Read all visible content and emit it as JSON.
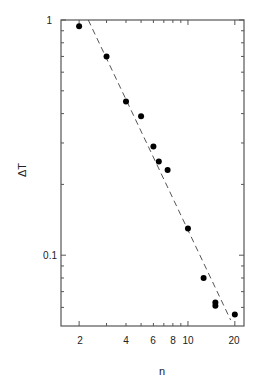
{
  "chart_data": {
    "type": "scatter",
    "title": "",
    "xlabel": "n",
    "ylabel": "ΔT",
    "xscale": "log",
    "yscale": "log",
    "xlim": [
      1.53,
      22.9
    ],
    "ylim": [
      0.05,
      1
    ],
    "grid": false,
    "legend": null,
    "x_ticks": [
      2,
      4,
      6,
      8,
      10,
      20
    ],
    "x_tick_labels": [
      "2",
      "4",
      "6",
      "8",
      "10",
      "20"
    ],
    "y_ticks": [
      1,
      0.1
    ],
    "y_tick_labels": [
      "1",
      "0.1"
    ],
    "series": [
      {
        "name": "data",
        "style": "filled-circle",
        "color": "#000000",
        "points": [
          {
            "x": 2,
            "y": 0.94
          },
          {
            "x": 3,
            "y": 0.7
          },
          {
            "x": 4,
            "y": 0.45
          },
          {
            "x": 5,
            "y": 0.39
          },
          {
            "x": 6,
            "y": 0.29
          },
          {
            "x": 6.5,
            "y": 0.25
          },
          {
            "x": 7.4,
            "y": 0.23
          },
          {
            "x": 10,
            "y": 0.13
          },
          {
            "x": 12.6,
            "y": 0.08
          },
          {
            "x": 15,
            "y": 0.063
          },
          {
            "x": 15,
            "y": 0.061
          },
          {
            "x": 20,
            "y": 0.056
          }
        ]
      },
      {
        "name": "fit",
        "style": "dashed-line",
        "color": "#555555",
        "points": [
          {
            "x": 2.29,
            "y": 1.0
          },
          {
            "x": 18.8,
            "y": 0.053
          }
        ]
      }
    ]
  },
  "labels": {
    "xlabel": "n",
    "ylabel": "ΔT",
    "y_tick_1": "1",
    "y_tick_01": "0.1",
    "x_ticks": [
      "2",
      "4",
      "6",
      "8",
      "10",
      "20"
    ]
  }
}
